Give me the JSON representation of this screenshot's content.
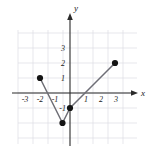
{
  "chart_data": {
    "type": "line",
    "title": "",
    "xlabel": "x",
    "ylabel": "y",
    "xlim": [
      -3.6,
      3.6
    ],
    "ylim": [
      -3.1,
      3.6
    ],
    "grid": true,
    "grid_color": "#d8d8e0",
    "axis_color": "#2a2a2a",
    "curve_color": "#6a6a72",
    "point_color": "#141414",
    "legend": "none",
    "xticks": [
      -3,
      -2,
      -1,
      1,
      2,
      3
    ],
    "yticks": [
      3,
      2,
      1,
      -1
    ],
    "xtick_labels": [
      "-3",
      "-2",
      "-1",
      "1",
      "2",
      "3"
    ],
    "ytick_labels": [
      "3",
      "2",
      "1",
      "-1"
    ],
    "series": [
      {
        "name": "piecewise-linear-curve",
        "x": [
          -2,
          -0.5,
          0,
          3
        ],
        "y": [
          1,
          -2,
          -1,
          2
        ]
      }
    ],
    "points": [
      {
        "label": "left-endpoint",
        "x": -2,
        "y": 1
      },
      {
        "label": "vertex-minimum",
        "x": -0.5,
        "y": -2
      },
      {
        "label": "interior-point",
        "x": 0,
        "y": -1
      },
      {
        "label": "right-endpoint",
        "x": 3,
        "y": 2
      }
    ],
    "annotations": []
  },
  "axes": {
    "x_name": "x",
    "y_name": "y"
  }
}
